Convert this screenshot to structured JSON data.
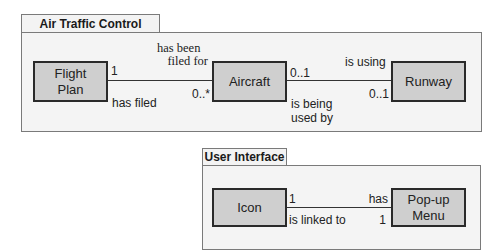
{
  "packages": [
    {
      "name": "Air Traffic Control",
      "classes": [
        {
          "name": "Flight\nPlan",
          "line1": "Flight",
          "line2": "Plan"
        },
        {
          "name": "Aircraft"
        },
        {
          "name": "Runway"
        }
      ],
      "associations": [
        {
          "from": "Flight Plan",
          "to": "Aircraft",
          "from_multiplicity": "1",
          "to_multiplicity": "0..*",
          "role_top_line1": "has been",
          "role_top_line2": "filed for",
          "role_bottom": "has filed"
        },
        {
          "from": "Aircraft",
          "to": "Runway",
          "from_multiplicity": "0..1",
          "to_multiplicity": "0..1",
          "role_top": "is using",
          "role_bottom_line1": "is being",
          "role_bottom_line2": "used by"
        }
      ]
    },
    {
      "name": "User Interface",
      "classes": [
        {
          "name": "Icon"
        },
        {
          "name": "Pop-up\nMenu",
          "line1": "Pop-up",
          "line2": "Menu"
        }
      ],
      "associations": [
        {
          "from": "Icon",
          "to": "Pop-up Menu",
          "from_multiplicity": "1",
          "to_multiplicity": "1",
          "role_top": "has",
          "role_bottom": "is linked to"
        }
      ]
    }
  ],
  "colors": {
    "class_fill": "#cfcfcf",
    "frame_fill": "#f4f4f4",
    "border": "#2a2a2a"
  }
}
